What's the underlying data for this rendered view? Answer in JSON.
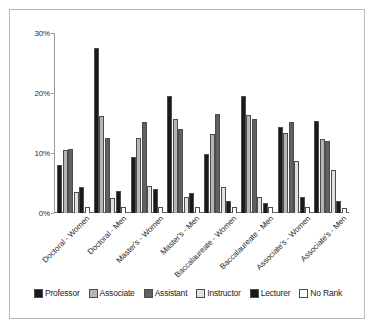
{
  "chart_data": {
    "type": "bar",
    "title": "",
    "subtitle": "",
    "xlabel": "",
    "ylabel": "",
    "ylim": [
      0,
      30
    ],
    "ytick_labels": [
      "0%",
      "10%",
      "20%",
      "30%"
    ],
    "ytick_values": [
      0,
      10,
      20,
      30
    ],
    "grid": false,
    "legend_position": "bottom",
    "categories": [
      "Doctoral - Women",
      "Doctoral - Men",
      "Master's - Women",
      "Master's - Men",
      "Baccalaureate - Women",
      "Baccalaureate - Men",
      "Associate's - Women",
      "Associate's - Men"
    ],
    "series": [
      {
        "name": "Professor",
        "color": "#1a1a1a",
        "values": [
          8.0,
          27.5,
          9.3,
          19.5,
          9.8,
          19.5,
          14.4,
          15.3
        ]
      },
      {
        "name": "Associate",
        "color": "#b5b5b5",
        "values": [
          10.5,
          16.2,
          12.5,
          15.7,
          13.2,
          16.4,
          13.3,
          12.3
        ]
      },
      {
        "name": "Assistant",
        "color": "#616161",
        "values": [
          10.7,
          12.5,
          15.2,
          14.0,
          16.5,
          15.6,
          15.2,
          12.0
        ]
      },
      {
        "name": "Instructor",
        "color": "#e2e2e2",
        "values": [
          3.5,
          2.5,
          4.5,
          2.7,
          4.3,
          2.7,
          8.7,
          7.2
        ]
      },
      {
        "name": "Lecturer",
        "color": "#1a1a1a",
        "values": [
          4.3,
          3.7,
          4.0,
          3.4,
          2.0,
          1.7,
          2.7,
          2.0
        ]
      },
      {
        "name": "No Rank",
        "color": "#ffffff",
        "values": [
          1.0,
          1.0,
          1.0,
          1.0,
          1.0,
          1.0,
          1.0,
          0.8
        ]
      }
    ]
  }
}
